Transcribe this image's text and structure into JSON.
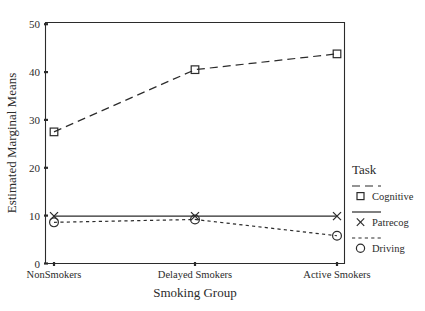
{
  "chart_data": {
    "type": "line",
    "title": "",
    "xlabel": "Smoking Group",
    "ylabel": "Estimated Marginal Means",
    "categories": [
      "NonSmokers",
      "Delayed Smokers",
      "Active Smokers"
    ],
    "ylim": [
      0,
      50
    ],
    "yticks": [
      0,
      10,
      20,
      30,
      40,
      50
    ],
    "ytick_labels": [
      "0",
      "10",
      "20",
      "30",
      "40",
      "50"
    ],
    "grid": false,
    "legend_position": "right",
    "legend_title": "Task",
    "series": [
      {
        "name": "Cognitive",
        "values": [
          27.5,
          40.5,
          43.8
        ],
        "marker": "square",
        "linestyle": "dashed",
        "color": "#2b2b2b"
      },
      {
        "name": "Patrecog",
        "values": [
          9.9,
          9.9,
          9.9
        ],
        "marker": "x",
        "linestyle": "solid",
        "color": "#2b2b2b"
      },
      {
        "name": "Driving",
        "values": [
          8.6,
          9.2,
          5.8
        ],
        "marker": "circle",
        "linestyle": "dotted",
        "color": "#2b2b2b"
      }
    ]
  },
  "axes": {
    "y_title": "Estimated Marginal Means",
    "x_title": "Smoking Group",
    "y_tick_0": "0",
    "y_tick_1": "10",
    "y_tick_2": "20",
    "y_tick_3": "30",
    "y_tick_4": "40",
    "y_tick_5": "50",
    "x_cat_0": "NonSmokers",
    "x_cat_1": "Delayed Smokers",
    "x_cat_2": "Active Smokers"
  },
  "legend": {
    "title": "Task",
    "items": [
      {
        "label": "Cognitive",
        "marker": "square-marker",
        "linestyle": "dashed"
      },
      {
        "label": "Patrecog",
        "marker": "x-marker",
        "linestyle": "solid"
      },
      {
        "label": "Driving",
        "marker": "circle-marker",
        "linestyle": "dotted"
      }
    ]
  },
  "colors": {
    "ink": "#2b2b2b",
    "background": "#ffffff"
  }
}
